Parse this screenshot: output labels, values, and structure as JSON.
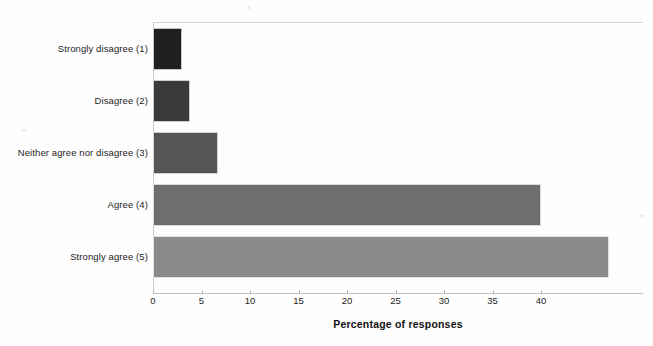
{
  "chart_data": {
    "type": "bar",
    "orientation": "horizontal",
    "title": "",
    "xlabel": "Percentage of responses",
    "ylabel": "",
    "categories": [
      "Strongly disagree (1)",
      "Disagree (2)",
      "Neither agree nor disagree (3)",
      "Agree (4)",
      "Strongly agree (5)"
    ],
    "values": [
      3,
      3.8,
      6.7,
      40,
      47
    ],
    "bar_colors": [
      "#1f1f1f",
      "#3a3a3a",
      "#555555",
      "#6e6e6e",
      "#8a8a8a"
    ],
    "xlim": [
      0,
      50.5
    ],
    "xticks": [
      0,
      5,
      10,
      15,
      20,
      25,
      30,
      35,
      40
    ],
    "xtick_labels": [
      "0",
      "5",
      "10",
      "15",
      "20",
      "25",
      "30",
      "35",
      "40"
    ],
    "grid": false,
    "legend": "none",
    "background_color": "#ffffff",
    "axis_color": "#c2c2c2"
  }
}
